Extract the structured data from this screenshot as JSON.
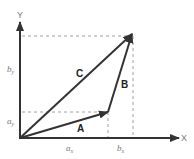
{
  "diagram": {
    "type": "vector-addition",
    "axes": {
      "x_label": "X",
      "y_label": "Y"
    },
    "vectors": [
      {
        "name": "A",
        "label": "A",
        "from": [
          0,
          0
        ],
        "to": "a"
      },
      {
        "name": "B",
        "label": "B",
        "from": "a",
        "to": "b"
      },
      {
        "name": "C",
        "label": "C",
        "from": [
          0,
          0
        ],
        "to": "b"
      }
    ],
    "component_labels": {
      "a_x": {
        "main": "a",
        "sub": "x"
      },
      "a_y": {
        "main": "a",
        "sub": "y"
      },
      "b_x": {
        "main": "b",
        "sub": "x"
      },
      "b_y": {
        "main": "b",
        "sub": "y"
      }
    },
    "colors": {
      "vector": "#333333",
      "axis": "#333333",
      "dashed": "#999999",
      "label": "#777777"
    }
  }
}
